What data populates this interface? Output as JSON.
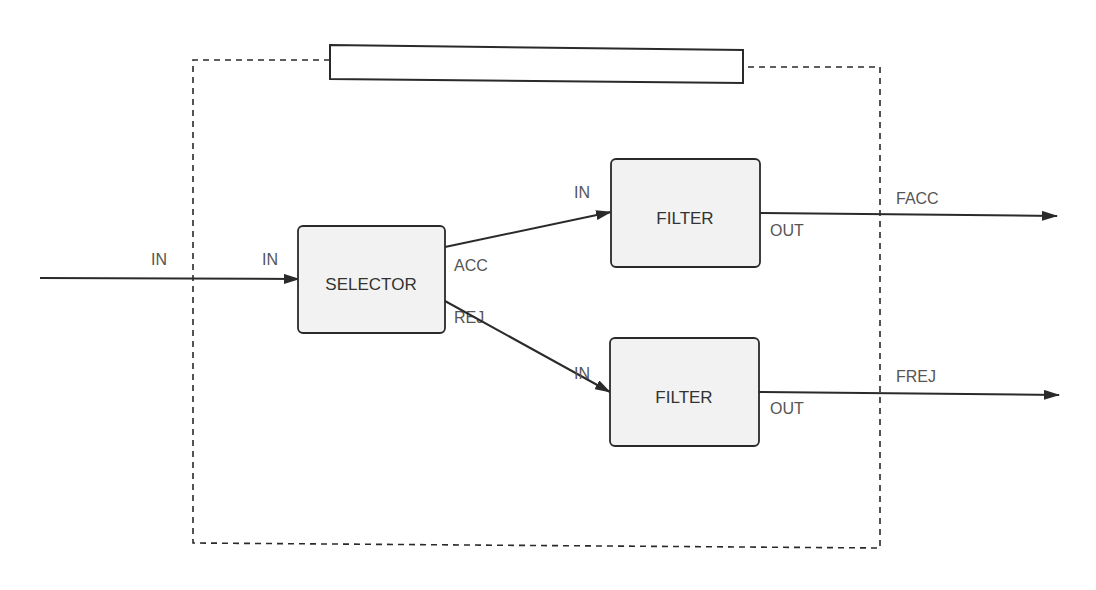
{
  "diagram": {
    "title_box_text": "",
    "colors": {
      "line": "#2a2a2a",
      "block_fill": "#f2f2f2",
      "label": "#555555",
      "background": "#ffffff"
    },
    "external_input": {
      "label": "IN"
    },
    "selector": {
      "label": "SELECTOR",
      "port_in": "IN",
      "port_acc": "ACC",
      "port_rej": "REJ"
    },
    "filter_top": {
      "label": "FILTER",
      "port_in": "IN",
      "port_out": "OUT"
    },
    "filter_bottom": {
      "label": "FILTER",
      "port_in": "IN",
      "port_out": "OUT"
    },
    "outputs": {
      "facc": "FACC",
      "frej": "FREJ"
    }
  }
}
